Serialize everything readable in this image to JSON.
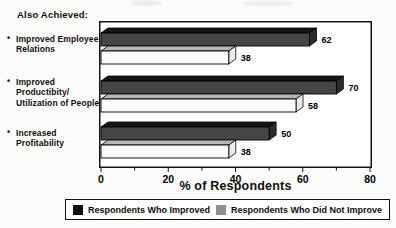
{
  "title": "Also Achieved:",
  "chart_data": {
    "type": "bar",
    "orientation": "horizontal",
    "style": "3d-extruded",
    "bullet": "•",
    "categories": [
      "Improved Employee\nRelations",
      "Improved\nProductibity/\nUtilization of People",
      "Increased\nProfitability"
    ],
    "series": [
      {
        "name": "Respondents Who Improved",
        "values": [
          62,
          70,
          50
        ],
        "color": "#454545",
        "top_color": "#161616",
        "end_color": "#2b2b2b",
        "legend_color": "#101010"
      },
      {
        "name": "Respondents Who Did Not Improve",
        "values": [
          38,
          58,
          38
        ],
        "color": "#fbfbfb",
        "top_color": "#b5b5b5",
        "end_color": "#ececec",
        "legend_color": "#8f8f8f"
      }
    ],
    "xlabel": "% of Respondents",
    "xlim": [
      0,
      80
    ],
    "xticks": [
      0,
      20,
      40,
      60,
      80
    ],
    "minor_tick_step": 10,
    "grid": false,
    "legend_position": "bottom"
  }
}
